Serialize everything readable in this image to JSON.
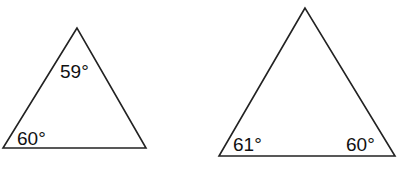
{
  "diagram": {
    "triangles": [
      {
        "id": "left",
        "vertices": [
          [
            77,
            28
          ],
          [
            3,
            148
          ],
          [
            146,
            148
          ]
        ],
        "angles": {
          "top": "59°",
          "bottom_left": "60°"
        }
      },
      {
        "id": "right",
        "vertices": [
          [
            305,
            8
          ],
          [
            219,
            156
          ],
          [
            395,
            156
          ]
        ],
        "angles": {
          "bottom_left": "61°",
          "bottom_right": "60°"
        }
      }
    ],
    "stroke_color": "#222222"
  }
}
